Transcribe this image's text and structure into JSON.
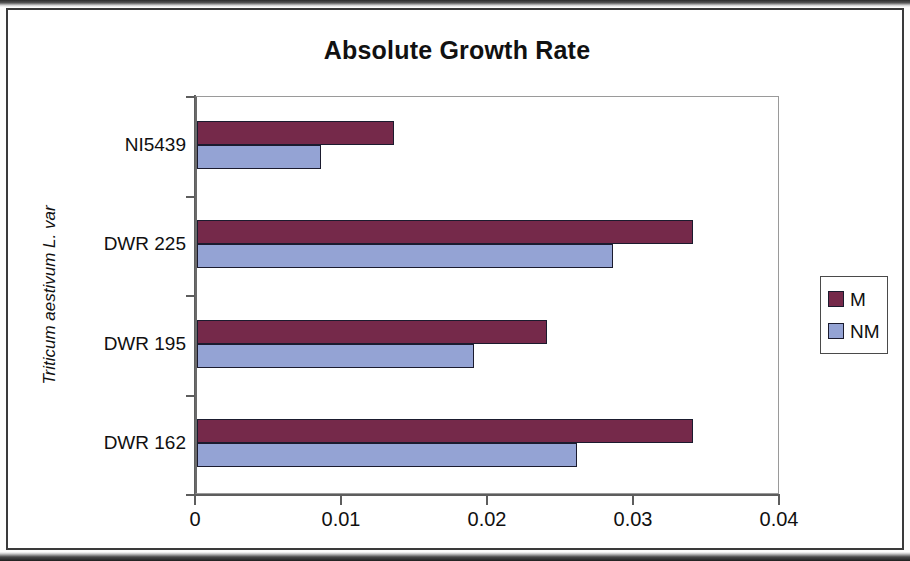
{
  "chart_data": {
    "type": "bar",
    "orientation": "horizontal",
    "title": "Absolute Growth Rate",
    "xlabel": "",
    "ylabel": "Triticum aestivum L. var",
    "categories": [
      "DWR 162",
      "DWR 195",
      "DWR 225",
      "NI5439"
    ],
    "series": [
      {
        "name": "M",
        "color": "#75294a",
        "values": [
          0.034,
          0.024,
          0.034,
          0.0135
        ]
      },
      {
        "name": "NM",
        "color": "#94a3d4",
        "values": [
          0.026,
          0.019,
          0.0285,
          0.0085
        ]
      }
    ],
    "xlim": [
      0,
      0.04
    ],
    "xticks": [
      "0",
      "0.01",
      "0.02",
      "0.03",
      "0.04"
    ],
    "xtick_values": [
      0,
      0.01,
      0.02,
      0.03,
      0.04
    ],
    "grid": false,
    "legend_position": "right"
  },
  "legend": {
    "entries": [
      {
        "label": "M"
      },
      {
        "label": "NM"
      }
    ]
  },
  "ghost_text": {
    "lines": [
      "selected for",
      "other",
      "from the",
      "results"
    ]
  }
}
